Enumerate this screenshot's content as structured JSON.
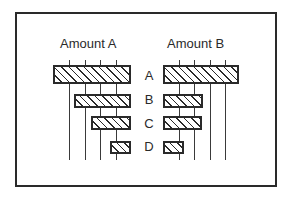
{
  "chart_data": {
    "type": "bar",
    "orientation": "horizontal",
    "layout": "back-to-back (butterfly) bar chart",
    "categories": [
      "A",
      "B",
      "C",
      "D"
    ],
    "series": [
      {
        "name": "Amount A",
        "values": [
          5.0,
          3.7,
          2.6,
          1.35
        ],
        "direction": "leftward"
      },
      {
        "name": "Amount B",
        "values": [
          4.9,
          2.6,
          2.5,
          1.35
        ],
        "direction": "rightward"
      }
    ],
    "title": "",
    "panel_titles": [
      "Amount A",
      "Amount B"
    ],
    "xlabel": "",
    "ylabel": "",
    "xlim": [
      0,
      5
    ],
    "gridlines": [
      1,
      2,
      3,
      4
    ],
    "grid": true,
    "tick_labels_shown": false,
    "legend": "none",
    "fill": "diagonal hatch",
    "colors": {
      "ink": "#2a2a2a",
      "background": "#ffffff"
    }
  },
  "labels": {
    "left_title": "Amount A",
    "right_title": "Amount B",
    "cat_a": "A",
    "cat_b": "B",
    "cat_c": "C",
    "cat_d": "D"
  }
}
